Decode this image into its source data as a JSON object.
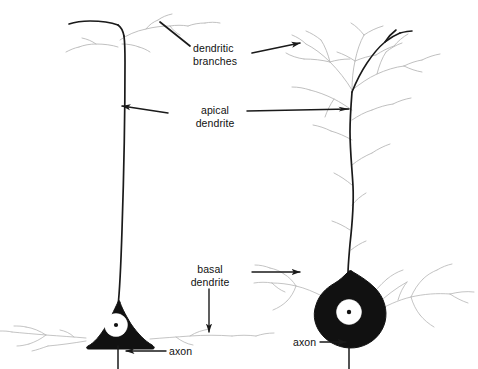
{
  "figure": {
    "background_color": "#ffffff",
    "ink_color": "#1a1a1a",
    "faint_color": "#b9b9b9",
    "soma_fill": "#111111",
    "nucleus_fill": "#ffffff"
  },
  "labels": {
    "dendritic_branches": "dendritic\nbranches",
    "apical_dendrite": "apical\ndendrite",
    "basal_dendrite": "basal\ndendrite",
    "axon_left": "axon",
    "axon_right": "axon"
  },
  "neurons": [
    {
      "name": "left-neuron",
      "soma_shape": "triangle",
      "soma_label": "pyramidal cell body",
      "has_nucleus": true,
      "has_nucleolus": true,
      "apical_tuft": "sparse",
      "basal_dendrites": "horizontal, sparse",
      "axon_direction": "down"
    },
    {
      "name": "right-neuron",
      "soma_shape": "round-teardrop",
      "soma_label": "round cell body",
      "has_nucleus": true,
      "has_nucleolus": true,
      "apical_tuft": "dense branched",
      "basal_dendrites": "horizontal, branched",
      "axon_direction": "down"
    }
  ],
  "annotations": [
    {
      "name": "dendritic-branches-left-pointer",
      "label_key": "dendritic_branches",
      "arrow": "none",
      "target": "left-neuron apical tuft"
    },
    {
      "name": "dendritic-branches-right-arrow",
      "label_key": "dendritic_branches",
      "arrow": "right",
      "target": "right-neuron apical tuft"
    },
    {
      "name": "apical-dendrite-left-arrow",
      "label_key": "apical_dendrite",
      "arrow": "left",
      "target": "left-neuron apical trunk"
    },
    {
      "name": "apical-dendrite-right-arrow",
      "label_key": "apical_dendrite",
      "arrow": "right",
      "target": "right-neuron apical trunk"
    },
    {
      "name": "basal-dendrite-right-arrow",
      "label_key": "basal_dendrite",
      "arrow": "right",
      "target": "right-neuron basal dendrites"
    },
    {
      "name": "basal-dendrite-down-arrow",
      "label_key": "basal_dendrite",
      "arrow": "down",
      "target": "left-neuron basal dendrites"
    },
    {
      "name": "axon-left-arrow",
      "label_key": "axon_left",
      "arrow": "left",
      "target": "left-neuron axon"
    },
    {
      "name": "axon-right-arrow",
      "label_key": "axon_right",
      "arrow": "right",
      "target": "right-neuron axon"
    }
  ]
}
